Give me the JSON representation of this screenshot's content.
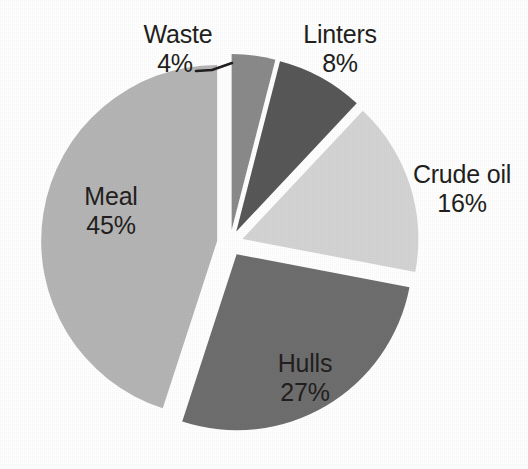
{
  "chart_data": {
    "type": "pie",
    "title": "",
    "subtitle": "",
    "xlabel": "",
    "ylabel": "",
    "legend_position": "none",
    "grid": false,
    "exploded": true,
    "unit": "%",
    "categories": [
      "Waste",
      "Linters",
      "Crude oil",
      "Hulls",
      "Meal"
    ],
    "values": [
      4,
      8,
      16,
      27,
      45
    ],
    "slices": [
      {
        "label": "Waste",
        "value": 4,
        "value_text": "4%",
        "color": "#8a8a8a",
        "label_placement": "outside",
        "has_leader_line": true
      },
      {
        "label": "Linters",
        "value": 8,
        "value_text": "8%",
        "color": "#585858",
        "label_placement": "outside",
        "has_leader_line": false
      },
      {
        "label": "Crude oil",
        "value": 16,
        "value_text": "16%",
        "color": "#d4d4d4",
        "label_placement": "outside",
        "has_leader_line": false
      },
      {
        "label": "Hulls",
        "value": 27,
        "value_text": "27%",
        "color": "#6e6e6e",
        "label_placement": "inside",
        "has_leader_line": false
      },
      {
        "label": "Meal",
        "value": 45,
        "value_text": "45%",
        "color": "#b5b5b5",
        "label_placement": "inside",
        "has_leader_line": false
      }
    ],
    "background_color": "#ffffff",
    "text_color": "#231f20"
  }
}
